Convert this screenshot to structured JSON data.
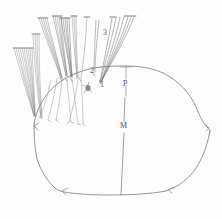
{
  "figure": {
    "type": "scientific-line-drawing",
    "background_color": "#fefefe",
    "ink_color": "#6e6e6e",
    "ink_color_dark": "#4a4a4a",
    "ink_color_light": "#9b9b9b",
    "width": 222,
    "height": 219
  },
  "labels": {
    "bundle_1": "1",
    "bundle_2": "2",
    "bundle_3": "3",
    "posterior_marker": "P",
    "median_marker": "M"
  },
  "caption_remnant": {
    "text": "",
    "visible": false
  },
  "elements": {
    "body_outline_name": "abdominal-segment-outline",
    "median_line_name": "median-reference-line",
    "posterior_line_name": "posterior-reference-line",
    "dark_spot_name": "pigment-spot"
  }
}
